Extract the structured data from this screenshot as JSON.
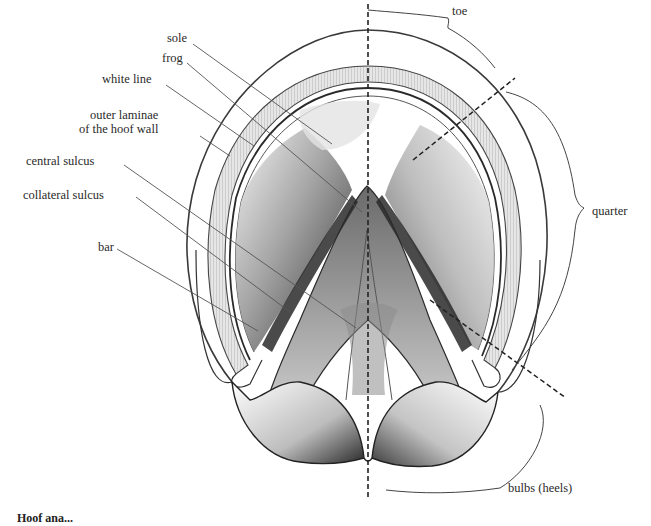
{
  "figure": {
    "caption_partial": "Hoof ana..."
  },
  "labels_left": [
    {
      "id": "sole",
      "text": "sole",
      "x": 167,
      "y": 38
    },
    {
      "id": "frog",
      "text": "frog",
      "x": 162,
      "y": 57
    },
    {
      "id": "white-line",
      "text": "white line",
      "x": 102,
      "y": 78
    },
    {
      "id": "outer-laminae",
      "text": "outer laminae\nof the hoof wall",
      "line1": "outer laminae",
      "line2": "of the hoof wall",
      "x": 83,
      "y": 108
    },
    {
      "id": "central-sulcus",
      "text": "central sulcus",
      "x": 26,
      "y": 155
    },
    {
      "id": "collateral-sulcus",
      "text": "collateral sulcus",
      "x": 23,
      "y": 187
    },
    {
      "id": "bar",
      "text": "bar",
      "x": 97,
      "y": 241
    }
  ],
  "labels_right": [
    {
      "id": "toe",
      "text": "toe",
      "x": 452,
      "y": 9
    },
    {
      "id": "quarter",
      "text": "quarter",
      "x": 592,
      "y": 206
    },
    {
      "id": "bulbs",
      "text": "bulbs (heels)",
      "x": 508,
      "y": 481
    }
  ],
  "colors": {
    "ink": "#2a2a2a",
    "leader": "#555555",
    "shade_dark": "#1e1e1e",
    "shade_mid": "#8a8a8a",
    "shade_light": "#d6d6d6",
    "background": "#ffffff"
  }
}
